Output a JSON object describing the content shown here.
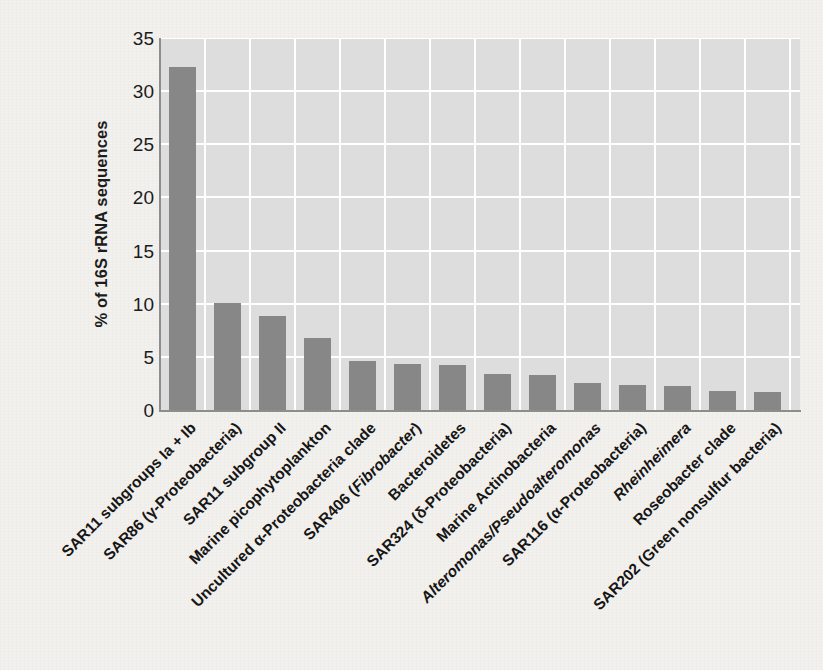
{
  "chart_data": {
    "type": "bar",
    "title": "",
    "xlabel": "",
    "ylabel": "% of 16S rRNA sequences",
    "ylim": [
      0,
      35
    ],
    "yticks": [
      0,
      5,
      10,
      15,
      20,
      25,
      30,
      35
    ],
    "ytick_labels": [
      "0",
      "5",
      "10",
      "15",
      "20",
      "25",
      "30",
      "35"
    ],
    "grid": "both",
    "legend": "none",
    "bar_color": "#878787",
    "plot_background": "#dddddd",
    "gridline_color": "#ffffff",
    "categories": [
      "SAR11 subgroups Ia + Ib",
      "SAR86 (γ-Proteobacteria)",
      "SAR11 subgroup II",
      "Marine picophytoplankton",
      "Uncultured α-Proteobacteria clade",
      "SAR406 (Fibrobacter)",
      "Bacteroidetes",
      "SAR324 (δ-Proteobacteria)",
      "Marine Actinobacteria",
      "Alteromonas/Pseudoalteromonas",
      "SAR116 (α-Proteobacteria)",
      "Rheinheimera",
      "Roseobacter clade",
      "SAR202 (Green nonsulfur bacteria)"
    ],
    "categories_rich": [
      [
        {
          "t": "SAR11 subgroups Ia + Ib",
          "i": false
        }
      ],
      [
        {
          "t": "SAR86 (γ-Proteobacteria)",
          "i": false
        }
      ],
      [
        {
          "t": "SAR11 subgroup II",
          "i": false
        }
      ],
      [
        {
          "t": "Marine picophytoplankton",
          "i": false
        }
      ],
      [
        {
          "t": "Uncultured α-Proteobacteria clade",
          "i": false
        }
      ],
      [
        {
          "t": "SAR406 (",
          "i": false
        },
        {
          "t": "Fibrobacter",
          "i": true
        },
        {
          "t": ")",
          "i": false
        }
      ],
      [
        {
          "t": "Bacteroidetes",
          "i": false
        }
      ],
      [
        {
          "t": "SAR324 (δ-Proteobacteria)",
          "i": false
        }
      ],
      [
        {
          "t": "Marine Actinobacteria",
          "i": false
        }
      ],
      [
        {
          "t": "Alteromonas/Pseudoalteromonas",
          "i": true
        }
      ],
      [
        {
          "t": "SAR116 (α-Proteobacteria)",
          "i": false
        }
      ],
      [
        {
          "t": "Rheinheimera",
          "i": true
        }
      ],
      [
        {
          "t": "Roseobacter clade",
          "i": false
        }
      ],
      [
        {
          "t": "SAR202 (Green nonsulfur bacteria)",
          "i": false
        }
      ]
    ],
    "values": [
      32.3,
      10.1,
      8.8,
      6.8,
      4.6,
      4.3,
      4.2,
      3.4,
      3.3,
      2.5,
      2.4,
      2.3,
      1.8,
      1.7
    ]
  }
}
